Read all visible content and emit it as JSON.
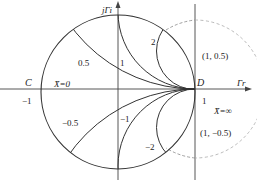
{
  "diagram": {
    "axes": {
      "horizontal_label": "Γr",
      "vertical_label": "jΓi"
    },
    "points": {
      "C": "C",
      "D": "D"
    },
    "reactance_labels": {
      "x_zero": "X̄=0",
      "x_inf": "X̄=∞",
      "pos_0_5": "0.5",
      "pos_1": "1",
      "pos_2": "2",
      "neg_0_5": "−0.5",
      "neg_1": "−1",
      "neg_2": "−2"
    },
    "tick_labels": {
      "minus_one": "−1",
      "one": "1"
    },
    "coordinates": {
      "upper": "(1, 0.5)",
      "lower": "(1, −0.5)"
    },
    "colors": {
      "line": "#333333",
      "dashed": "#888888"
    }
  }
}
